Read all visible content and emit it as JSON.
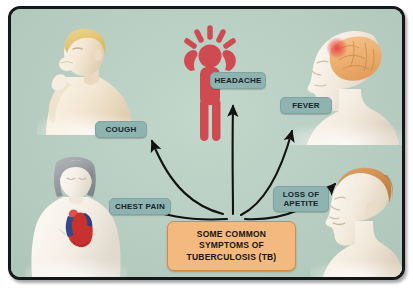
{
  "poster": {
    "title_box": {
      "name": "central-title-box",
      "lines": [
        "SOME COMMON",
        "SYMPTOMS OF",
        "TUBERCULOSIS (TB)"
      ],
      "bg_color": "#f4b97f",
      "border_color": "#d98a41",
      "text_color": "#17140f"
    },
    "background_color": "#b7cdc1",
    "frame_border_color": "#15181a"
  },
  "symptoms": [
    {
      "id": "cough",
      "label": "COUGH",
      "illustration": "man-coughing-hand-to-mouth",
      "position": "top-left"
    },
    {
      "id": "headache",
      "label": "HEADACHE",
      "illustration": "red-stick-figure-holding-head",
      "position": "top-center"
    },
    {
      "id": "fever",
      "label": "FEVER",
      "illustration": "head-profile-with-brain-hotspot",
      "position": "top-right"
    },
    {
      "id": "chest-pain",
      "label": "CHEST PAIN",
      "illustration": "female-torso-with-heart",
      "position": "bottom-left"
    },
    {
      "id": "loss-of-appetite",
      "label": "LOSS OF\nAPETITE",
      "illustration": "male-head-profile",
      "position": "bottom-right"
    }
  ],
  "chip_style": {
    "bg_color": "#8fb3b0",
    "text_color": "#15222a"
  },
  "arrows": {
    "color": "#121212",
    "count": 5,
    "description": "five curved arrows fanning out from above the central box to each symptom label"
  },
  "palette": {
    "stick_figure": "#cf4b52",
    "brain": "#f0b478",
    "heart_red": "#c8322e",
    "hair_blond": "#e8c776",
    "hair_orange": "#d98b4e",
    "hair_gray": "#9aa0a4",
    "skin": "#f7efe4"
  }
}
